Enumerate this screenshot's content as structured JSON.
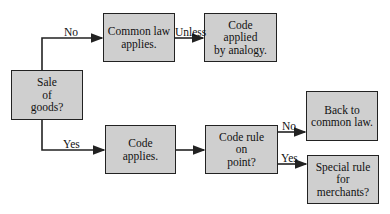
{
  "nodes": {
    "sale": "Sale\nof\ngoods?",
    "common_law": "Common law\napplies.",
    "code_analogy": "Code\napplied\nby analogy.",
    "code_applies": "Code\napplies.",
    "code_rule": "Code rule\non\npoint?",
    "back_common": "Back to\ncommon law.",
    "special_rule": "Special rule\nfor\nmerchants?"
  },
  "edges": {
    "sale_no": "No",
    "sale_yes": "Yes",
    "unless": "Unless",
    "rule_no": "No",
    "rule_yes": "Yes"
  },
  "colors": {
    "box_fill": "#cfcfcf",
    "line": "#222222"
  }
}
